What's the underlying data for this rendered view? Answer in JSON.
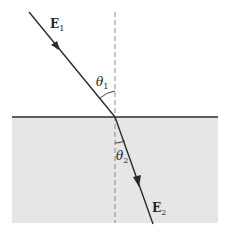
{
  "diagram": {
    "labels": {
      "incident_field": {
        "symbol": "E",
        "subscript": "1"
      },
      "refracted_field": {
        "symbol": "E",
        "subscript": "2"
      },
      "incidence_angle": {
        "symbol": "θ",
        "subscript": "1"
      },
      "refraction_angle": {
        "symbol": "θ",
        "subscript": "2"
      }
    },
    "colors": {
      "line": "#2b2b2b",
      "medium2_fill": "#e6e6e6",
      "normal_dash": "#8a8a8a",
      "background": "#ffffff"
    }
  }
}
